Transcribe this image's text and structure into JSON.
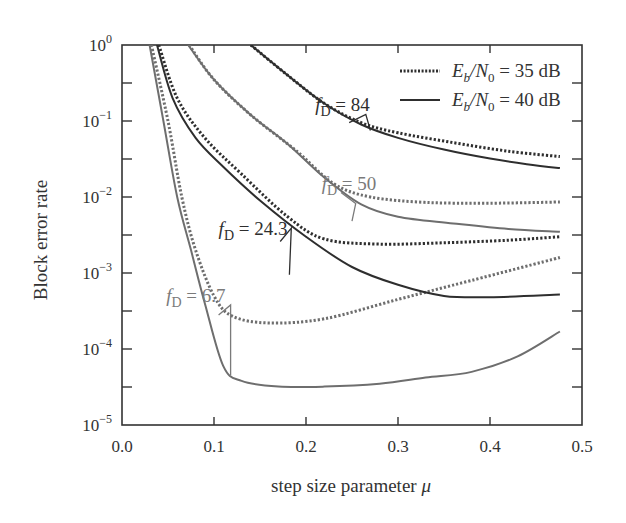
{
  "chart_data": {
    "type": "line",
    "title": "",
    "xlabel": "step size parameter μ",
    "ylabel": "Block error rate",
    "xscale": "linear",
    "yscale": "log",
    "xlim": [
      0.0,
      0.5
    ],
    "ylim": [
      1e-05,
      1
    ],
    "x_ticks": [
      0.0,
      0.1,
      0.2,
      0.3,
      0.4,
      0.5
    ],
    "x_tick_labels": [
      "0.0",
      "0.1",
      "0.2",
      "0.3",
      "0.4",
      "0.5"
    ],
    "y_ticks": [
      1,
      0.1,
      0.01,
      0.001,
      0.0001,
      1e-05
    ],
    "y_tick_labels": [
      {
        "base": "10",
        "exp": "0"
      },
      {
        "base": "10",
        "exp": "−1"
      },
      {
        "base": "10",
        "exp": "−2"
      },
      {
        "base": "10",
        "exp": "−3"
      },
      {
        "base": "10",
        "exp": "−4"
      },
      {
        "base": "10",
        "exp": "−5"
      }
    ],
    "grid": false,
    "legend_position": "upper right",
    "legend": [
      {
        "style": "dotted",
        "label_prefix": "E",
        "label_sub1": "b",
        "label_mid": "/N",
        "label_sub2": "0",
        "label_suffix": " = 35 dB"
      },
      {
        "style": "solid",
        "label_prefix": "E",
        "label_sub1": "b",
        "label_mid": "/N",
        "label_sub2": "0",
        "label_suffix": " = 40 dB"
      }
    ],
    "series": [
      {
        "name": "fD=6.7, Eb/N0=40 dB",
        "fD": "6.7",
        "ebn0": "40 dB",
        "style": "solid",
        "color": "#6e6e6e",
        "x": [
          0.03,
          0.045,
          0.06,
          0.075,
          0.09,
          0.11,
          0.13,
          0.17,
          0.22,
          0.28,
          0.33,
          0.38,
          0.43,
          0.476
        ],
        "y": [
          1,
          0.1,
          0.01,
          0.002,
          0.0004,
          6e-05,
          3.8e-05,
          3.2e-05,
          3.2e-05,
          3.5e-05,
          4.2e-05,
          5e-05,
          8e-05,
          0.00017
        ]
      },
      {
        "name": "fD=6.7, Eb/N0=35 dB",
        "fD": "6.7",
        "ebn0": "35 dB",
        "style": "dotted",
        "color": "#6e6e6e",
        "x": [
          0.032,
          0.05,
          0.065,
          0.08,
          0.1,
          0.12,
          0.16,
          0.22,
          0.3,
          0.38,
          0.476
        ],
        "y": [
          1,
          0.1,
          0.01,
          0.002,
          0.0005,
          0.00027,
          0.00022,
          0.00025,
          0.00045,
          0.0008,
          0.0016
        ]
      },
      {
        "name": "fD=24.3, Eb/N0=40 dB",
        "fD": "24.3",
        "ebn0": "40 dB",
        "style": "solid",
        "color": "#2e2e2e",
        "x": [
          0.038,
          0.055,
          0.08,
          0.11,
          0.15,
          0.2,
          0.25,
          0.3,
          0.35,
          0.4,
          0.476
        ],
        "y": [
          1,
          0.2,
          0.06,
          0.025,
          0.009,
          0.003,
          0.0012,
          0.0007,
          0.0005,
          0.00048,
          0.00052
        ]
      },
      {
        "name": "fD=24.3, Eb/N0=35 dB",
        "fD": "24.3",
        "ebn0": "35 dB",
        "style": "dotted",
        "color": "#2e2e2e",
        "x": [
          0.04,
          0.06,
          0.09,
          0.13,
          0.18,
          0.22,
          0.28,
          0.35,
          0.42,
          0.476
        ],
        "y": [
          1,
          0.2,
          0.06,
          0.02,
          0.0055,
          0.0028,
          0.0024,
          0.0025,
          0.0027,
          0.003
        ]
      },
      {
        "name": "fD=50, Eb/N0=40 dB",
        "fD": "50",
        "ebn0": "40 dB",
        "style": "solid",
        "color": "#6e6e6e",
        "x": [
          0.072,
          0.1,
          0.14,
          0.18,
          0.22,
          0.26,
          0.3,
          0.36,
          0.42,
          0.476
        ],
        "y": [
          1,
          0.35,
          0.12,
          0.05,
          0.018,
          0.008,
          0.0055,
          0.0045,
          0.0038,
          0.0035
        ]
      },
      {
        "name": "fD=50, Eb/N0=35 dB",
        "fD": "50",
        "ebn0": "35 dB",
        "style": "dotted",
        "color": "#6e6e6e",
        "x": [
          0.073,
          0.1,
          0.14,
          0.19,
          0.23,
          0.27,
          0.33,
          0.4,
          0.476
        ],
        "y": [
          1,
          0.35,
          0.12,
          0.04,
          0.015,
          0.01,
          0.0085,
          0.0083,
          0.0086
        ]
      },
      {
        "name": "fD=84, Eb/N0=40 dB",
        "fD": "84",
        "ebn0": "40 dB",
        "style": "solid",
        "color": "#2e2e2e",
        "x": [
          0.14,
          0.18,
          0.22,
          0.26,
          0.3,
          0.35,
          0.4,
          0.44,
          0.476
        ],
        "y": [
          1,
          0.4,
          0.17,
          0.09,
          0.06,
          0.042,
          0.032,
          0.027,
          0.024
        ]
      },
      {
        "name": "fD=84, Eb/N0=35 dB",
        "fD": "84",
        "ebn0": "35 dB",
        "style": "dotted",
        "color": "#2e2e2e",
        "x": [
          0.14,
          0.18,
          0.22,
          0.26,
          0.3,
          0.36,
          0.42,
          0.476
        ],
        "y": [
          1,
          0.4,
          0.17,
          0.095,
          0.07,
          0.052,
          0.04,
          0.034
        ]
      }
    ],
    "annotations": [
      {
        "text_main": "f",
        "text_sub": "D",
        "text_value": " = 84",
        "color": "#2e2e2e",
        "label_x": 0.21,
        "label_y": 0.135,
        "pointer": [
          [
            0.247,
            0.095
          ],
          [
            0.265,
            0.122
          ],
          [
            0.27,
            0.075
          ]
        ]
      },
      {
        "text_main": "f",
        "text_sub": "D",
        "text_value": " = 50",
        "color": "#7a7a7a",
        "label_x": 0.217,
        "label_y": 0.0125,
        "pointer": [
          [
            0.238,
            0.0115
          ],
          [
            0.254,
            0.0082
          ],
          [
            0.25,
            0.0048
          ]
        ]
      },
      {
        "text_main": "f",
        "text_sub": "D",
        "text_value": " = 24.3",
        "color": "#2e2e2e",
        "label_x": 0.105,
        "label_y": 0.0032,
        "pointer": [
          [
            0.172,
            0.0026
          ],
          [
            0.184,
            0.0039
          ],
          [
            0.182,
            0.00095
          ]
        ]
      },
      {
        "text_main": "f",
        "text_sub": "D",
        "text_value": " = 6.7",
        "color": "#7a7a7a",
        "label_x": 0.048,
        "label_y": 0.00042,
        "pointer": [
          [
            0.105,
            0.00028
          ],
          [
            0.118,
            0.00038
          ],
          [
            0.118,
            4.5e-05
          ]
        ]
      }
    ]
  },
  "layout": {
    "plot_left": 122,
    "plot_top": 45,
    "plot_right": 582,
    "plot_bottom": 425
  }
}
